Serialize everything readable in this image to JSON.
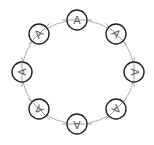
{
  "diagram": {
    "type": "ring-of-nodes",
    "center": {
      "x": 78,
      "y": 72
    },
    "ring_radius": {
      "rx": 56,
      "ry": 52
    },
    "node_radius": 10,
    "colors": {
      "background": "#ffffff",
      "node_stroke": "#222222",
      "ring_stroke": "#9a9a9a",
      "label": "#666666"
    },
    "nodes": [
      {
        "label": "A",
        "position": "top",
        "x": 77,
        "y": 20,
        "angle": 0
      },
      {
        "label": "A",
        "position": "top-right",
        "x": 116,
        "y": 34,
        "angle": 45
      },
      {
        "label": "A",
        "position": "right",
        "x": 134,
        "y": 72,
        "angle": 90
      },
      {
        "label": "A",
        "position": "bottom-right",
        "x": 116,
        "y": 109,
        "angle": 135
      },
      {
        "label": "A",
        "position": "bottom",
        "x": 77,
        "y": 124,
        "angle": 180
      },
      {
        "label": "A",
        "position": "bottom-left",
        "x": 39,
        "y": 109,
        "angle": 225
      },
      {
        "label": "A",
        "position": "left",
        "x": 22,
        "y": 72,
        "angle": 270
      },
      {
        "label": "A",
        "position": "top-left",
        "x": 39,
        "y": 34,
        "angle": 315
      }
    ]
  }
}
